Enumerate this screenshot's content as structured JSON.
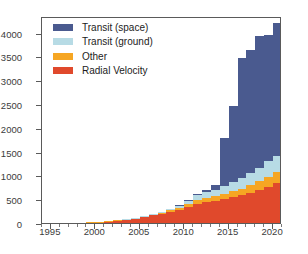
{
  "chart_data": {
    "type": "bar",
    "stacked": true,
    "title": "",
    "xlabel": "",
    "ylabel": "",
    "xlim": [
      1994,
      2021
    ],
    "ylim": [
      0,
      4350
    ],
    "yticks": [
      0,
      500,
      1000,
      1500,
      2000,
      2500,
      3000,
      3500,
      4000
    ],
    "xticks": [
      1995,
      2000,
      2005,
      2010,
      2015,
      2020
    ],
    "grid": false,
    "legend_position": "upper left",
    "categories": [
      1995,
      1996,
      1997,
      1998,
      1999,
      2000,
      2001,
      2002,
      2003,
      2004,
      2005,
      2006,
      2007,
      2008,
      2009,
      2010,
      2011,
      2012,
      2013,
      2014,
      2015,
      2016,
      2017,
      2018,
      2019,
      2020
    ],
    "series": [
      {
        "name": "Radial Velocity",
        "color": "#e0492c",
        "values": [
          0,
          1,
          2,
          3,
          13,
          26,
          38,
          53,
          70,
          90,
          130,
          160,
          185,
          230,
          270,
          330,
          400,
          440,
          465,
          505,
          545,
          585,
          640,
          700,
          760,
          835
        ]
      },
      {
        "name": "Other",
        "color": "#f6a623",
        "values": [
          0,
          0,
          0,
          0,
          2,
          3,
          4,
          5,
          8,
          12,
          18,
          25,
          32,
          40,
          52,
          65,
          75,
          85,
          95,
          110,
          125,
          140,
          160,
          185,
          215,
          230
        ]
      },
      {
        "name": "Transit (ground)",
        "color": "#b7dbe5",
        "values": [
          0,
          0,
          0,
          0,
          0,
          0,
          0,
          1,
          2,
          4,
          8,
          14,
          22,
          35,
          55,
          80,
          105,
          125,
          140,
          165,
          190,
          215,
          250,
          280,
          320,
          350
        ]
      },
      {
        "name": "Transit (space)",
        "color": "#4a5a8f",
        "values": [
          0,
          0,
          0,
          0,
          0,
          0,
          0,
          0,
          0,
          0,
          0,
          0,
          0,
          0,
          5,
          15,
          30,
          45,
          90,
          1015,
          1605,
          2520,
          2585,
          2770,
          2655,
          2785
        ]
      }
    ],
    "totals": [
      0,
      1,
      2,
      3,
      15,
      29,
      42,
      59,
      80,
      106,
      156,
      199,
      239,
      305,
      382,
      490,
      610,
      695,
      790,
      1795,
      2465,
      3460,
      3635,
      3935,
      3950,
      4200
    ]
  },
  "legend": {
    "items": [
      {
        "label": "Transit (space)",
        "color": "#4a5a8f"
      },
      {
        "label": "Transit (ground)",
        "color": "#b7dbe5"
      },
      {
        "label": "Other",
        "color": "#f6a623"
      },
      {
        "label": "Radial Velocity",
        "color": "#e0492c"
      }
    ]
  },
  "axes": {
    "y_tick_labels": [
      "0",
      "500",
      "1000",
      "1500",
      "2000",
      "2500",
      "3000",
      "3500",
      "4000"
    ],
    "x_tick_labels": [
      "1995",
      "2000",
      "2005",
      "2010",
      "2015",
      "2020"
    ]
  }
}
